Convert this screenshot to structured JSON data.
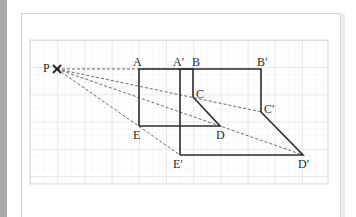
{
  "diagram": {
    "title": "",
    "type": "enlargement-construction",
    "colors": {
      "grid_minor": "#e6e6e6",
      "grid_major": "#cfcfcf",
      "line": "#2b2b2b",
      "dashed": "#666666",
      "label": "#2a2a2a"
    },
    "center": {
      "label": "P",
      "x": 57,
      "y": 69
    },
    "points": {
      "A": {
        "label": "A",
        "x": 139,
        "y": 69
      },
      "B": {
        "label": "B",
        "x": 193,
        "y": 69
      },
      "C": {
        "label": "C",
        "x": 193,
        "y": 97
      },
      "D": {
        "label": "D",
        "x": 220,
        "y": 126
      },
      "E": {
        "label": "E",
        "x": 139,
        "y": 126
      },
      "A2": {
        "label": "A′",
        "x": 180,
        "y": 69
      },
      "B2": {
        "label": "B′",
        "x": 261,
        "y": 69
      },
      "C2": {
        "label": "C′",
        "x": 262,
        "y": 112
      },
      "D2": {
        "label": "D′",
        "x": 303,
        "y": 155
      },
      "E2": {
        "label": "E′",
        "x": 180,
        "y": 155
      }
    },
    "shapes": [
      {
        "name": "object",
        "vertices": [
          "A",
          "B",
          "C",
          "D",
          "E"
        ]
      },
      {
        "name": "image",
        "vertices": [
          "A′",
          "B′",
          "C′",
          "D′",
          "E′"
        ]
      }
    ],
    "rays": [
      "P→A′",
      "P→C′",
      "P→D′",
      "P→E′"
    ]
  }
}
